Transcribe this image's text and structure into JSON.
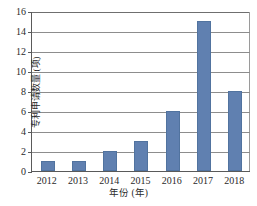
{
  "chart_data": {
    "type": "bar",
    "title": "",
    "subtitle": "",
    "xlabel": "年份 (年)",
    "ylabel": "专利申请数量 (项)",
    "categories": [
      "2012",
      "2013",
      "2014",
      "2015",
      "2016",
      "2017",
      "2018"
    ],
    "values": [
      1,
      1,
      2,
      3,
      6,
      15,
      8
    ],
    "series": [
      {
        "name": "专利申请数量",
        "values": [
          1,
          1,
          2,
          3,
          6,
          15,
          8
        ]
      }
    ],
    "ylim": [
      0,
      16
    ],
    "ytick_step": 2,
    "yticks": [
      "0",
      "2",
      "4",
      "6",
      "8",
      "10",
      "12",
      "14",
      "16"
    ],
    "grid": true,
    "grid_axis": "y",
    "legend": false,
    "legend_position": "none",
    "bar_color": "#6080b0",
    "bar_edge_color": "#51739f",
    "grid_color": "#8d8d8d",
    "axis_color": "#5a5a5a",
    "background": "#ffffff"
  }
}
